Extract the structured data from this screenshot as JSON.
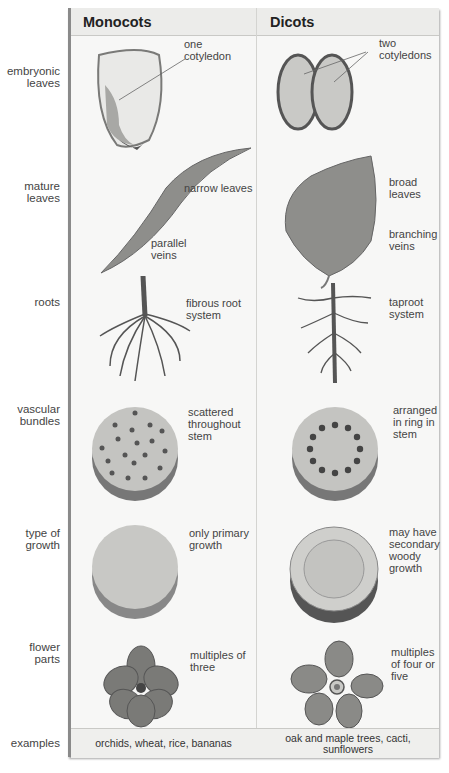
{
  "columns": [
    "Monocots",
    "Dicots"
  ],
  "rows": [
    {
      "label": [
        "embryonic",
        "leaves"
      ],
      "monocot": [
        "one",
        "cotyledon"
      ],
      "dicot": [
        "two",
        "cotyledons"
      ]
    },
    {
      "label": [
        "mature",
        "leaves"
      ],
      "monocot": [
        "narrow leaves"
      ],
      "monocot2": [
        "parallel",
        "veins"
      ],
      "dicot": [
        "broad",
        "leaves"
      ],
      "dicot2": [
        "branching",
        "veins"
      ]
    },
    {
      "label": [
        "roots"
      ],
      "monocot": [
        "fibrous root",
        "system"
      ],
      "dicot": [
        "taproot",
        "system"
      ]
    },
    {
      "label": [
        "vascular",
        "bundles"
      ],
      "monocot": [
        "scattered",
        "throughout",
        "stem"
      ],
      "dicot": [
        "arranged",
        "in ring in",
        "stem"
      ]
    },
    {
      "label": [
        "type of",
        "growth"
      ],
      "monocot": [
        "only primary",
        "growth"
      ],
      "dicot": [
        "may have",
        "secondary",
        "woody",
        "growth"
      ]
    },
    {
      "label": [
        "flower",
        "parts"
      ],
      "monocot": [
        "multiples of",
        "three"
      ],
      "dicot": [
        "multiples",
        "of four or",
        "five"
      ]
    },
    {
      "label": [
        "examples"
      ],
      "monocot": [
        "orchids, wheat, rice, bananas"
      ],
      "dicot": [
        "oak and maple trees, cacti,",
        "sunflowers"
      ]
    }
  ],
  "icons": [
    "seed-monocot-icon",
    "seed-dicot-icon",
    "narrow-leaf-icon",
    "broad-leaf-icon",
    "fibrous-root-icon",
    "taproot-icon",
    "scattered-bundles-icon",
    "ring-bundles-icon",
    "primary-growth-icon",
    "secondary-growth-icon",
    "flower-three-icon",
    "flower-five-icon"
  ],
  "colors": {
    "table_bg": "#f7f7f6",
    "header_bg": "#ececea",
    "illustration": "#8e8e8b"
  }
}
